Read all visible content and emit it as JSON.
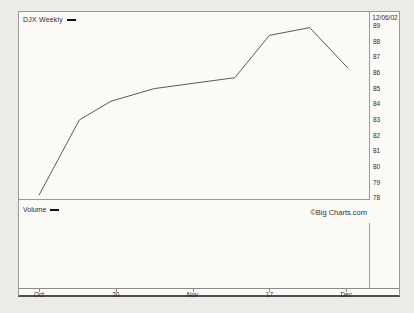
{
  "header": {
    "legend_label": "DJX Weekly",
    "date_label": "12/06/02"
  },
  "volume_pane": {
    "label": "Volume"
  },
  "footer": {
    "copyright": "©Big Charts.com"
  },
  "colors": {
    "line": "#5a5a5a",
    "border": "#9a9a9a",
    "text": "#2f2f2f",
    "page_bg": "#ecebe8",
    "figure_bg": "#fbfaf7",
    "legend_dash": "#111111"
  },
  "chart_data": {
    "type": "line",
    "title": "DJX Weekly",
    "subtitle": "",
    "xlabel": "",
    "ylabel": "",
    "last_date": "12/06/02",
    "grid": false,
    "legend_position": "top-left",
    "ylim": [
      78,
      89
    ],
    "y_ticks": [
      78,
      79,
      80,
      81,
      82,
      83,
      84,
      85,
      86,
      87,
      88,
      89
    ],
    "x_ticks": [
      {
        "pos": 0,
        "label": "Oct"
      },
      {
        "pos": 4,
        "label": "20"
      },
      {
        "pos": 8,
        "label": "Nov"
      },
      {
        "pos": 12,
        "label": "17"
      },
      {
        "pos": 16,
        "label": "Dec"
      }
    ],
    "series": [
      {
        "name": "DJX",
        "points": [
          {
            "x": 0,
            "y": 78.2
          },
          {
            "x": 2.1,
            "y": 83.0
          },
          {
            "x": 3.75,
            "y": 84.2
          },
          {
            "x": 6,
            "y": 85.0
          },
          {
            "x": 10.2,
            "y": 85.7
          },
          {
            "x": 12,
            "y": 88.4
          },
          {
            "x": 14.1,
            "y": 88.9
          },
          {
            "x": 16.1,
            "y": 86.3
          }
        ]
      }
    ],
    "volume_series": []
  }
}
